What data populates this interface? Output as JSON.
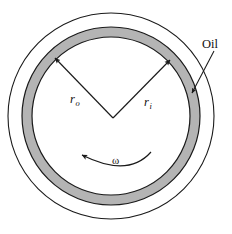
{
  "figure": {
    "background_color": "#ffffff",
    "line_color": "#1a1a1a",
    "oil_band_fill": "#b4b4b4",
    "center": {
      "x": 111,
      "y": 116
    },
    "circles": {
      "housing_outer_radius": 103,
      "oil_band_outer_radius": 89,
      "oil_band_inner_radius": 79
    }
  },
  "labels": {
    "oil": "Oil",
    "outer_radius_symbol": "r",
    "outer_radius_subscript": "o",
    "inner_radius_symbol": "r",
    "inner_radius_subscript": "i",
    "angular_velocity": "ω"
  },
  "annotations": {
    "oil_leader": {
      "name": "oil-leader-line",
      "from": {
        "x": 213,
        "y": 52
      },
      "to": {
        "x": 192,
        "y": 93
      }
    },
    "outer_radius_arrow": {
      "name": "outer-radius-arrow",
      "from": {
        "x": 113,
        "y": 118
      },
      "to": {
        "x": 55,
        "y": 58
      }
    },
    "inner_radius_arrow": {
      "name": "inner-radius-arrow",
      "from": {
        "x": 113,
        "y": 118
      },
      "to": {
        "x": 170,
        "y": 60
      }
    },
    "rotation_arc": {
      "name": "rotation-direction-arc",
      "direction": "counterclockwise",
      "arrow_tip": {
        "x": 79,
        "y": 153
      }
    }
  }
}
